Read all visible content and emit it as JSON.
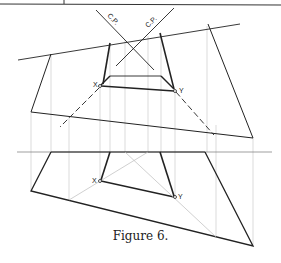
{
  "figure": {
    "caption": "Figure 6."
  },
  "labels": {
    "cp_left": "C.P.",
    "cp_right": "C.P.",
    "point_x_top": "X",
    "point_y_top": "Y",
    "point_x_front": "X",
    "point_y_front": "Y"
  },
  "colors": {
    "ink": "#222222",
    "construction": "#bbbbbb"
  }
}
